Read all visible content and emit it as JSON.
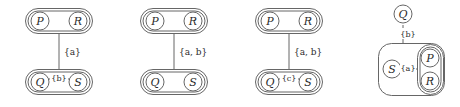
{
  "figure": {
    "type": "graph-diagram-sequence",
    "panel_count": 4,
    "stroke_color": "#555555",
    "text_color": "#2b2b2b",
    "background_color": "#ffffff"
  },
  "panels": [
    {
      "id": "panel-1",
      "index": "1",
      "groups": [
        {
          "id": "panel-1-group-top",
          "name": "top-cluster",
          "nodes": [
            "P",
            "R"
          ],
          "orientation": "horizontal",
          "double_border": true
        },
        {
          "id": "panel-1-group-bottom",
          "name": "bottom-cluster",
          "nodes": [
            "Q",
            "S"
          ],
          "orientation": "horizontal",
          "double_border": true
        }
      ],
      "edges": [
        {
          "id": "panel-1-edge-vertical",
          "from": "top-cluster",
          "to": "bottom-cluster",
          "label": "{a}",
          "orientation": "vertical"
        },
        {
          "id": "panel-1-edge-qs",
          "from": "Q",
          "to": "S",
          "label": "{b}",
          "orientation": "horizontal"
        }
      ]
    },
    {
      "id": "panel-2",
      "index": "2",
      "groups": [
        {
          "id": "panel-2-group-top",
          "name": "top-cluster",
          "nodes": [
            "P",
            "R"
          ],
          "orientation": "horizontal",
          "double_border": true
        },
        {
          "id": "panel-2-group-bottom",
          "name": "bottom-cluster",
          "nodes": [
            "Q",
            "S"
          ],
          "orientation": "horizontal",
          "double_border": true
        }
      ],
      "edges": [
        {
          "id": "panel-2-edge-vertical",
          "from": "top-cluster",
          "to": "bottom-cluster",
          "label": "{a, b}",
          "orientation": "vertical"
        }
      ]
    },
    {
      "id": "panel-3",
      "index": "3",
      "groups": [
        {
          "id": "panel-3-group-top",
          "name": "top-cluster",
          "nodes": [
            "P",
            "R"
          ],
          "orientation": "horizontal",
          "double_border": true
        },
        {
          "id": "panel-3-group-bottom",
          "name": "bottom-cluster",
          "nodes": [
            "Q",
            "S"
          ],
          "orientation": "horizontal",
          "double_border": true
        }
      ],
      "edges": [
        {
          "id": "panel-3-edge-vertical",
          "from": "top-cluster",
          "to": "bottom-cluster",
          "label": "{a, b}",
          "orientation": "vertical"
        },
        {
          "id": "panel-3-edge-qs",
          "from": "Q",
          "to": "S",
          "label": "{c}",
          "orientation": "horizontal"
        }
      ]
    },
    {
      "id": "panel-4",
      "index": "4",
      "groups": [
        {
          "id": "panel-4-group-outer",
          "name": "outer-cluster",
          "nodes": [
            "S",
            "P",
            "R"
          ],
          "orientation": "nested",
          "double_border": false
        },
        {
          "id": "panel-4-group-inner",
          "name": "inner-cluster",
          "nodes": [
            "P",
            "R"
          ],
          "orientation": "vertical",
          "double_border": true
        }
      ],
      "standalone_nodes": [
        "Q"
      ],
      "edges": [
        {
          "id": "panel-4-edge-vertical",
          "from": "Q",
          "to": "outer-cluster",
          "label": "{b}",
          "orientation": "vertical"
        },
        {
          "id": "panel-4-edge-s-inner",
          "from": "S",
          "to": "inner-cluster",
          "label": "{a}",
          "orientation": "horizontal"
        }
      ]
    }
  ],
  "nodes": {
    "p1_P": "P",
    "p1_R": "R",
    "p1_Q": "Q",
    "p1_S": "S",
    "p2_P": "P",
    "p2_R": "R",
    "p2_Q": "Q",
    "p2_S": "S",
    "p3_P": "P",
    "p3_R": "R",
    "p3_Q": "Q",
    "p3_S": "S",
    "p4_Q": "Q",
    "p4_S": "S",
    "p4_P": "P",
    "p4_R": "R"
  },
  "labels": {
    "p1_vertical": "{a}",
    "p1_horizontal": "{b}",
    "p2_vertical": "{a, b}",
    "p3_vertical": "{a, b}",
    "p3_horizontal": "{c}",
    "p4_vertical": "{b}",
    "p4_horizontal": "{a}"
  }
}
